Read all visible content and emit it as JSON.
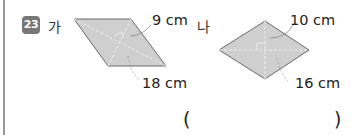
{
  "problem": {
    "number": "23",
    "figures": [
      {
        "label": "가",
        "shape": "rhombus",
        "diagonal_short": "9 cm",
        "diagonal_long": "18 cm"
      },
      {
        "label": "나",
        "shape": "rhombus",
        "diagonal_short": "10 cm",
        "diagonal_long": "16 cm"
      }
    ],
    "answer_open": "(",
    "answer_close": ")"
  },
  "colors": {
    "fill": "#cfcfcf",
    "stroke": "#6a6a6a",
    "badge": "#777777"
  }
}
